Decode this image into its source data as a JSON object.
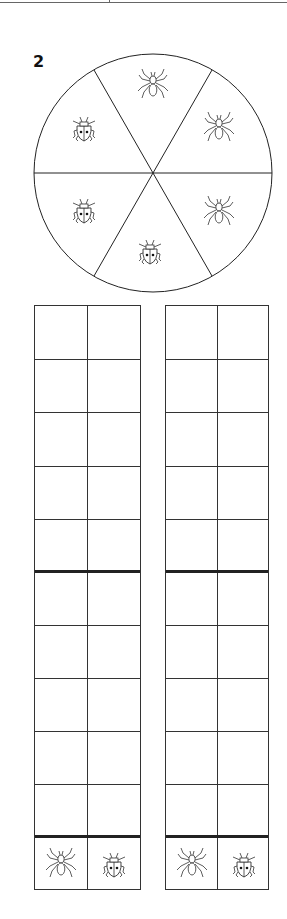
{
  "question": {
    "number": "2"
  },
  "spinner": {
    "sections": [
      {
        "position": "top",
        "creature": "spider"
      },
      {
        "position": "upper-right",
        "creature": "spider"
      },
      {
        "position": "lower-right",
        "creature": "spider"
      },
      {
        "position": "bottom",
        "creature": "ladybug"
      },
      {
        "position": "lower-left",
        "creature": "ladybug"
      },
      {
        "position": "upper-left",
        "creature": "ladybug"
      }
    ]
  },
  "tally_grids": [
    {
      "rows": 10,
      "columns": 2,
      "column_labels": [
        "spider",
        "ladybug"
      ]
    },
    {
      "rows": 10,
      "columns": 2,
      "column_labels": [
        "spider",
        "ladybug"
      ]
    }
  ]
}
